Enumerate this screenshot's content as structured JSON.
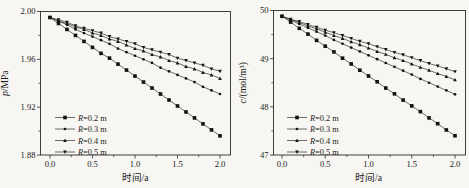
{
  "figure": {
    "background": "#f7f6f2",
    "ink": "#2a2a2a",
    "line_color": "#3c3c3c",
    "marker_color": "#111111"
  },
  "chart_data": [
    {
      "id": "pressure-vs-time",
      "type": "line",
      "title": "",
      "xlabel": "时间/a",
      "ylabel": "p/MPa",
      "xlim": [
        -0.12,
        2.12
      ],
      "ylim": [
        1.88,
        2.0
      ],
      "grid": false,
      "legend_position": "lower-left",
      "xticks": [
        0.0,
        0.5,
        1.0,
        1.5,
        2.0
      ],
      "xtick_labels": [
        "0.0",
        "0.5",
        "1.0",
        "1.5",
        "2.0"
      ],
      "x_minor_ticks": [
        0.25,
        0.75,
        1.25,
        1.75
      ],
      "yticks": [
        1.88,
        1.92,
        1.96,
        2.0
      ],
      "ytick_labels": [
        "1.88",
        "1.92",
        "1.96",
        "2.00"
      ],
      "y_minor_ticks": [
        1.9,
        1.94,
        1.98
      ],
      "x": [
        0.0,
        0.1,
        0.2,
        0.3,
        0.4,
        0.5,
        0.6,
        0.7,
        0.8,
        0.9,
        1.0,
        1.1,
        1.2,
        1.3,
        1.4,
        1.5,
        1.6,
        1.7,
        1.8,
        1.9,
        2.0
      ],
      "series": [
        {
          "name": "R=0.2 m",
          "marker": "square",
          "values": [
            1.995,
            1.99,
            1.985,
            1.98,
            1.975,
            1.97,
            1.965,
            1.961,
            1.956,
            1.951,
            1.946,
            1.941,
            1.936,
            1.931,
            1.926,
            1.921,
            1.916,
            1.911,
            1.906,
            1.901,
            1.896
          ]
        },
        {
          "name": "R=0.3 m",
          "marker": "circle",
          "values": [
            1.995,
            1.992,
            1.989,
            1.985,
            1.982,
            1.979,
            1.976,
            1.973,
            1.969,
            1.966,
            1.963,
            1.96,
            1.957,
            1.953,
            1.95,
            1.947,
            1.944,
            1.941,
            1.937,
            1.934,
            1.931
          ]
        },
        {
          "name": "R=0.4 m",
          "marker": "triangle-up",
          "values": [
            1.995,
            1.992,
            1.99,
            1.987,
            1.985,
            1.982,
            1.98,
            1.977,
            1.975,
            1.972,
            1.969,
            1.967,
            1.964,
            1.962,
            1.959,
            1.957,
            1.954,
            1.952,
            1.949,
            1.947,
            1.944
          ]
        },
        {
          "name": "R=0.5 m",
          "marker": "triangle-down",
          "values": [
            1.995,
            1.993,
            1.991,
            1.988,
            1.986,
            1.984,
            1.982,
            1.979,
            1.977,
            1.975,
            1.973,
            1.97,
            1.968,
            1.966,
            1.964,
            1.961,
            1.959,
            1.957,
            1.955,
            1.952,
            1.95
          ]
        }
      ]
    },
    {
      "id": "concentration-vs-time",
      "type": "line",
      "title": "",
      "xlabel": "时间/a",
      "ylabel": "c/(mol/m³)",
      "xlim": [
        -0.12,
        2.12
      ],
      "ylim": [
        47,
        50
      ],
      "grid": false,
      "legend_position": "lower-left",
      "xticks": [
        0.0,
        0.5,
        1.0,
        1.5,
        2.0
      ],
      "xtick_labels": [
        "0.0",
        "0.5",
        "1.0",
        "1.5",
        "2.0"
      ],
      "x_minor_ticks": [
        0.25,
        0.75,
        1.25,
        1.75
      ],
      "yticks": [
        47,
        48,
        49,
        50
      ],
      "ytick_labels": [
        "47",
        "48",
        "49",
        "50"
      ],
      "y_minor_ticks": [
        47.5,
        48.5,
        49.5
      ],
      "x": [
        0.0,
        0.1,
        0.2,
        0.3,
        0.4,
        0.5,
        0.6,
        0.7,
        0.8,
        0.9,
        1.0,
        1.1,
        1.2,
        1.3,
        1.4,
        1.5,
        1.6,
        1.7,
        1.8,
        1.9,
        2.0
      ],
      "series": [
        {
          "name": "R=0.2 m",
          "marker": "square",
          "values": [
            49.88,
            49.76,
            49.63,
            49.51,
            49.38,
            49.26,
            49.14,
            49.01,
            48.89,
            48.76,
            48.64,
            48.52,
            48.39,
            48.27,
            48.14,
            48.02,
            47.9,
            47.77,
            47.65,
            47.52,
            47.4
          ]
        },
        {
          "name": "R=0.3 m",
          "marker": "circle",
          "values": [
            49.88,
            49.8,
            49.72,
            49.64,
            49.56,
            49.48,
            49.39,
            49.31,
            49.23,
            49.15,
            49.07,
            48.99,
            48.91,
            48.83,
            48.75,
            48.67,
            48.58,
            48.5,
            48.42,
            48.34,
            48.26
          ]
        },
        {
          "name": "R=0.4 m",
          "marker": "triangle-up",
          "values": [
            49.88,
            49.81,
            49.75,
            49.68,
            49.62,
            49.55,
            49.48,
            49.42,
            49.35,
            49.29,
            49.22,
            49.15,
            49.09,
            49.02,
            48.96,
            48.89,
            48.82,
            48.76,
            48.69,
            48.63,
            48.56
          ]
        },
        {
          "name": "R=0.5 m",
          "marker": "triangle-down",
          "values": [
            49.88,
            49.82,
            49.77,
            49.71,
            49.65,
            49.59,
            49.54,
            49.48,
            49.42,
            49.36,
            49.31,
            49.25,
            49.19,
            49.13,
            49.08,
            49.02,
            48.96,
            48.9,
            48.85,
            48.79,
            48.73
          ]
        }
      ]
    }
  ]
}
